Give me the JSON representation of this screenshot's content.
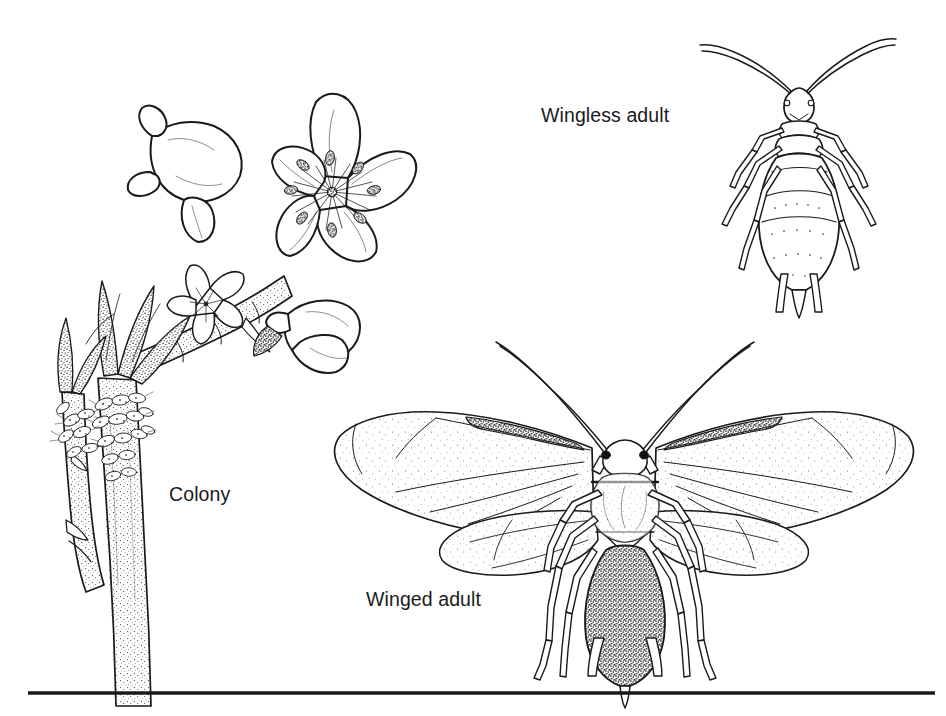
{
  "figure": {
    "type": "scientific-line-illustration",
    "style": "black-and-white pen-and-ink stipple drawing",
    "background_color": "#ffffff",
    "ink_color": "#1a1a1a",
    "width": 946,
    "height": 716
  },
  "labels": {
    "wingless_adult": "Wingless adult",
    "colony": "Colony",
    "winged_adult": "Winged adult"
  },
  "panels": [
    {
      "id": "colony",
      "label": "Colony",
      "label_position": {
        "x": 169,
        "y": 483
      },
      "description": "Flowering shoot with open blossoms, buds, stippled leaves and two woody stems encrusted with a dense cluster of aphids",
      "elements": [
        "open blossom with five petals",
        "partly open blossom",
        "flower bud",
        "small secondary flower",
        "stippled leaves",
        "woody branch",
        "main stem",
        "side stem",
        "aphid cluster on stems"
      ]
    },
    {
      "id": "wingless-adult",
      "label": "Wingless adult",
      "label_position": {
        "x": 541,
        "y": 104
      },
      "description": "Dorsal view of an apterous aphid with long swept-back antennae, segmented abdomen, six legs and paired cornicles",
      "elements": [
        "antennae",
        "head",
        "thorax",
        "segmented abdomen",
        "six legs",
        "cornicles",
        "cauda"
      ]
    },
    {
      "id": "winged-adult",
      "label": "Winged adult",
      "label_position": {
        "x": 366,
        "y": 588
      },
      "description": "Dorsal view of an alate aphid with two pairs of membranous wings, dark pterostigma on each forewing, stippled abdomen and black compound eyes",
      "elements": [
        "forewings with pterostigma",
        "hindwings",
        "wing veins",
        "antennae",
        "black compound eyes",
        "head",
        "thorax",
        "stippled abdomen",
        "six legs",
        "cornicles",
        "cauda"
      ]
    }
  ],
  "rule": {
    "name": "bottom-divider",
    "x1": 28,
    "x2": 935,
    "y": 693,
    "thickness": 3.5,
    "color": "#1a1a1a"
  }
}
